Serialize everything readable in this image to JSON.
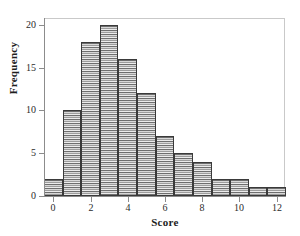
{
  "chart_data": {
    "type": "bar",
    "title": "",
    "subtitle": "",
    "xlabel": "Score",
    "ylabel": "Frequency",
    "categories": [
      "0",
      "1",
      "2",
      "3",
      "4",
      "5",
      "6",
      "7",
      "8",
      "9",
      "10",
      "11",
      "12"
    ],
    "x": [
      0,
      1,
      2,
      3,
      4,
      5,
      6,
      7,
      8,
      9,
      10,
      11,
      12
    ],
    "values": [
      2,
      10,
      18,
      20,
      16,
      12,
      7,
      5,
      4,
      2,
      2,
      1,
      1
    ],
    "bin_width": 1,
    "xlim": [
      -0.5,
      12.5
    ],
    "ylim": [
      0,
      20.8
    ],
    "xticks": [
      0,
      2,
      4,
      6,
      8,
      10,
      12
    ],
    "xtick_labels": [
      "0",
      "2",
      "4",
      "6",
      "8",
      "10",
      "12"
    ],
    "yticks": [
      0,
      5,
      10,
      15,
      20
    ],
    "ytick_labels": [
      "0",
      "5",
      "10",
      "15",
      "20"
    ],
    "grid": false,
    "legend": null,
    "legend_position": "none",
    "annotations": [],
    "colors": {
      "bar_fill": "#b9b9b9",
      "bar_edge": "#3a3a3a",
      "axis": "#8c8c8c",
      "frame": "#c9c9c9",
      "text": "#1e1e1e",
      "background": "#ffffff"
    }
  }
}
